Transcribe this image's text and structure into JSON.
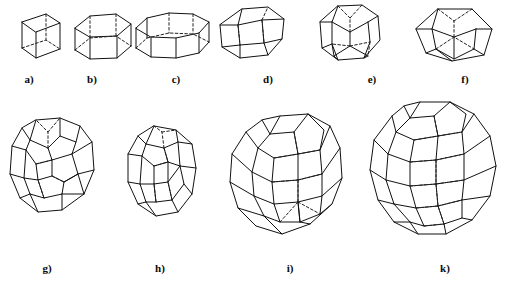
{
  "figure": {
    "background_color": "#ffffff",
    "stroke_color": "#111111",
    "hidden_edge_color": "#222222",
    "rows": 2,
    "items_per_row": [
      6,
      4
    ]
  },
  "shapes": [
    {
      "id": "a",
      "caption": "a)",
      "name": "cube",
      "row": 1,
      "x": 16,
      "y": 8,
      "w": 44,
      "h": 50,
      "caption_x": 9,
      "caption_y": 73,
      "geometry": {
        "kind": "prism",
        "sides": 4,
        "top": [
          [
            6,
            14
          ],
          [
            30,
            6
          ],
          [
            44,
            15
          ],
          [
            20,
            24
          ]
        ],
        "bottom": [
          [
            6,
            40
          ],
          [
            30,
            32
          ],
          [
            44,
            41
          ],
          [
            20,
            50
          ]
        ],
        "visible_verticals": [
          0,
          1,
          2
        ],
        "hidden_vertical": 3,
        "hidden_top": [],
        "hidden_bottom": [
          [
            0,
            3
          ],
          [
            3,
            2
          ]
        ]
      }
    },
    {
      "id": "b",
      "caption": "b)",
      "name": "hexagonal-prism",
      "row": 1,
      "x": 72,
      "y": 6,
      "w": 62,
      "h": 54,
      "caption_x": 72,
      "caption_y": 73,
      "geometry": {
        "kind": "prism",
        "sides": 6,
        "top": [
          [
            3,
            22
          ],
          [
            18,
            10
          ],
          [
            44,
            8
          ],
          [
            59,
            18
          ],
          [
            45,
            30
          ],
          [
            18,
            31
          ]
        ],
        "bottom": [
          [
            3,
            44
          ],
          [
            18,
            34
          ],
          [
            44,
            32
          ],
          [
            59,
            40
          ],
          [
            45,
            52
          ],
          [
            18,
            53
          ]
        ],
        "visible_verticals": [
          0,
          1,
          3,
          4,
          5
        ],
        "hidden_vertical": 2,
        "hidden_top": [
          [
            1,
            2
          ],
          [
            2,
            3
          ]
        ],
        "hidden_bottom": [
          [
            1,
            2
          ],
          [
            2,
            3
          ]
        ]
      }
    },
    {
      "id": "c",
      "caption": "c)",
      "name": "octagonal-prism",
      "row": 1,
      "x": 133,
      "y": 6,
      "w": 80,
      "h": 54,
      "caption_x": 156,
      "caption_y": 73,
      "geometry": {
        "kind": "prism",
        "sides": 8,
        "top": [
          [
            3,
            22
          ],
          [
            14,
            12
          ],
          [
            36,
            7
          ],
          [
            60,
            8
          ],
          [
            76,
            16
          ],
          [
            66,
            27
          ],
          [
            43,
            32
          ],
          [
            18,
            31
          ]
        ],
        "bottom": [
          [
            3,
            42
          ],
          [
            14,
            32
          ],
          [
            36,
            27
          ],
          [
            60,
            28
          ],
          [
            76,
            36
          ],
          [
            66,
            47
          ],
          [
            43,
            52
          ],
          [
            18,
            51
          ]
        ],
        "visible_verticals": [
          0,
          1,
          4,
          5,
          6,
          7
        ],
        "hidden_vertical": 2,
        "hidden_vertical_b": 3,
        "hidden_top": [
          [
            1,
            2
          ],
          [
            2,
            3
          ],
          [
            3,
            4
          ]
        ],
        "hidden_bottom": [
          [
            1,
            2
          ],
          [
            2,
            3
          ],
          [
            3,
            4
          ]
        ]
      }
    },
    {
      "id": "d",
      "caption": "d)",
      "name": "truncated-octahedron",
      "row": 1,
      "x": 216,
      "y": 3,
      "w": 72,
      "h": 60,
      "caption_x": 248,
      "caption_y": 73
    },
    {
      "id": "e",
      "caption": "e)",
      "name": "rhombicuboctahedron",
      "row": 1,
      "x": 314,
      "y": 2,
      "w": 70,
      "h": 62,
      "caption_x": 352,
      "caption_y": 73
    },
    {
      "id": "f",
      "caption": "f)",
      "name": "elongated-dodecahedron",
      "row": 1,
      "x": 412,
      "y": 3,
      "w": 82,
      "h": 60,
      "caption_x": 445,
      "caption_y": 73
    },
    {
      "id": "g",
      "caption": "g)",
      "name": "truncated-cuboctahedron",
      "row": 2,
      "x": 8,
      "y": 116,
      "w": 92,
      "h": 104,
      "caption_x": 27,
      "caption_y": 262
    },
    {
      "id": "h",
      "caption": "h)",
      "name": "truncated-cuboctahedron-alt-view",
      "row": 2,
      "x": 120,
      "y": 122,
      "w": 82,
      "h": 98,
      "caption_x": 140,
      "caption_y": 262
    },
    {
      "id": "i",
      "caption": "i)",
      "name": "truncated-rhombicuboctahedron",
      "row": 2,
      "x": 224,
      "y": 112,
      "w": 122,
      "h": 126,
      "caption_x": 270,
      "caption_y": 262
    },
    {
      "id": "k",
      "caption": "k)",
      "name": "great-rhombicuboctahedron",
      "row": 2,
      "x": 358,
      "y": 98,
      "w": 146,
      "h": 146,
      "caption_x": 425,
      "caption_y": 262
    }
  ]
}
